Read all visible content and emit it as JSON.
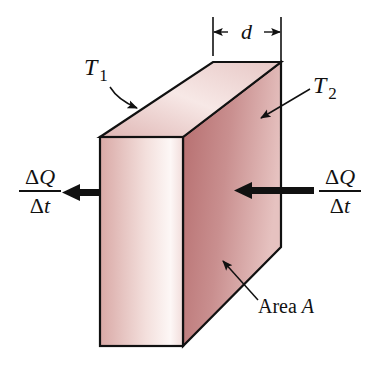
{
  "diagram": {
    "type": "heat-conduction-slab",
    "labels": {
      "thickness": "d",
      "t1_symbol": "T",
      "t1_subscript": "1",
      "t2_symbol": "T",
      "t2_subscript": "2",
      "area_prefix": "Area ",
      "area_symbol": "A"
    },
    "heat_flow_left": {
      "numerator_delta": "Δ",
      "numerator_var": "Q",
      "denominator_delta": "Δ",
      "denominator_var": "t"
    },
    "heat_flow_right": {
      "numerator_delta": "Δ",
      "numerator_var": "Q",
      "denominator_delta": "Δ",
      "denominator_var": "t"
    },
    "colors": {
      "front_face_light": "#fbf3f1",
      "front_face_dark": "#d9a7a4",
      "side_face_dark": "#b86f70",
      "side_face_light": "#e7c3c1",
      "top_face_light": "#f8eae8",
      "top_face_dark": "#dcb2b0",
      "outline": "#111111"
    }
  }
}
